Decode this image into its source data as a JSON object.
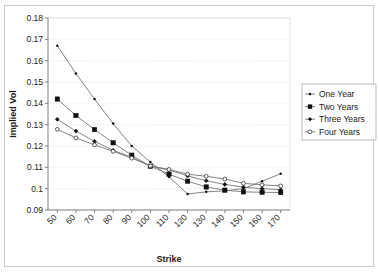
{
  "chart_data": {
    "type": "line",
    "title": "",
    "xlabel": "Strike",
    "ylabel": "Implied Vol",
    "x": [
      50,
      60,
      70,
      80,
      90,
      100,
      110,
      120,
      130,
      140,
      150,
      160,
      170
    ],
    "xlim": [
      45,
      175
    ],
    "ylim": [
      0.09,
      0.18
    ],
    "xticks": [
      "50",
      "60",
      "70",
      "80",
      "90",
      "100",
      "110",
      "120",
      "130",
      "140",
      "150",
      "160",
      "170"
    ],
    "yticks": [
      "0.09",
      "0.1",
      "0.11",
      "0.12",
      "0.13",
      "0.14",
      "0.15",
      "0.16",
      "0.17",
      "0.18"
    ],
    "grid": "horizontal-dotted",
    "legend_position": "right",
    "series": [
      {
        "name": "One Year",
        "marker": "small-dot",
        "values": [
          0.167,
          0.154,
          0.142,
          0.1305,
          0.12,
          0.1125,
          0.1055,
          0.0975,
          0.0985,
          0.099,
          0.1,
          0.1035,
          0.107
        ]
      },
      {
        "name": "Two Years",
        "marker": "filled-square",
        "values": [
          0.142,
          0.1343,
          0.1277,
          0.1215,
          0.1157,
          0.1105,
          0.1068,
          0.1035,
          0.1008,
          0.0993,
          0.0985,
          0.0983,
          0.0982
        ]
      },
      {
        "name": "Three Years",
        "marker": "small-filled-diamond",
        "values": [
          0.1325,
          0.127,
          0.1222,
          0.118,
          0.1147,
          0.1105,
          0.1088,
          0.106,
          0.1037,
          0.102,
          0.1007,
          0.1,
          0.0995
        ]
      },
      {
        "name": "Four Years",
        "marker": "open-circle",
        "values": [
          0.1278,
          0.1238,
          0.1205,
          0.1175,
          0.1143,
          0.1107,
          0.109,
          0.1068,
          0.1058,
          0.1045,
          0.1025,
          0.1018,
          0.1013
        ]
      }
    ]
  },
  "legend": {
    "entries": [
      {
        "label": "One Year"
      },
      {
        "label": "Two Years"
      },
      {
        "label": "Three Years"
      },
      {
        "label": "Four Years"
      }
    ]
  },
  "colors": {
    "line": "#555555",
    "marker": "#111111",
    "grid": "#d9d9d9",
    "axis": "#808080",
    "frame": "#c8c8c8",
    "text": "#1a1a1a",
    "background": "#ffffff"
  }
}
